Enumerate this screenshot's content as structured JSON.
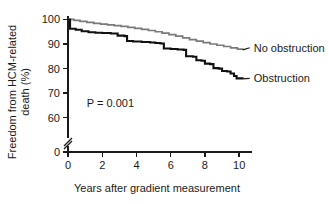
{
  "chart_data": {
    "type": "line",
    "title": "",
    "xlabel": "Years after gradient measurement",
    "ylabel_line1": "Freedom from HCM-related",
    "ylabel_line2": "death (%)",
    "xlim": [
      0,
      10.4
    ],
    "ylim": [
      55,
      101
    ],
    "xticks": [
      0,
      2,
      4,
      6,
      8,
      10
    ],
    "xtick_labels": [
      "0",
      "2",
      "4",
      "6",
      "8",
      "10"
    ],
    "yticks": [
      60,
      70,
      80,
      90,
      100
    ],
    "ytick_labels": [
      "60",
      "70",
      "80",
      "90",
      "100"
    ],
    "y_zero_label": "0",
    "axis_break": true,
    "grid": false,
    "legend_position": "inline-right",
    "annotations": [
      {
        "name": "p-value",
        "text": "P = 0.001",
        "x": 1.1,
        "y": 64.5
      }
    ],
    "series": [
      {
        "name": "No obstruction",
        "label": "No obstruction",
        "color": "#7a7a7a",
        "end_label_x": 10.5,
        "end_label_y": 88.5,
        "x": [
          0.0,
          0.35,
          0.7,
          1.1,
          1.5,
          1.9,
          2.3,
          2.7,
          3.1,
          3.5,
          3.9,
          4.3,
          4.7,
          5.1,
          5.5,
          5.9,
          6.3,
          6.7,
          7.1,
          7.5,
          7.9,
          8.3,
          8.7,
          9.1,
          9.5,
          9.9,
          10.2
        ],
        "y": [
          100.0,
          99.6,
          99.2,
          98.8,
          98.4,
          98.1,
          97.8,
          97.5,
          97.2,
          96.8,
          96.4,
          96.0,
          95.5,
          95.0,
          94.4,
          93.8,
          93.2,
          92.5,
          91.8,
          91.2,
          90.6,
          90.0,
          89.5,
          89.0,
          88.4,
          87.9,
          87.6
        ]
      },
      {
        "name": "Obstruction",
        "label": "Obstruction",
        "color": "#111111",
        "end_label_x": 10.5,
        "end_label_y": 76.0,
        "x": [
          0.0,
          0.12,
          0.45,
          0.8,
          1.2,
          1.6,
          2.0,
          2.5,
          2.9,
          3.3,
          3.45,
          3.8,
          4.3,
          4.8,
          5.1,
          5.4,
          5.6,
          6.0,
          6.4,
          6.75,
          6.9,
          7.3,
          7.5,
          7.8,
          8.0,
          8.3,
          8.5,
          8.8,
          9.0,
          9.3,
          9.5,
          9.7,
          9.85,
          10.2
        ],
        "y": [
          100.0,
          96.2,
          95.8,
          95.2,
          94.8,
          94.6,
          94.5,
          94.3,
          93.4,
          93.2,
          91.2,
          91.0,
          90.8,
          90.6,
          90.4,
          90.2,
          88.2,
          88.0,
          87.8,
          87.6,
          85.0,
          84.8,
          83.4,
          83.2,
          82.0,
          81.8,
          80.2,
          80.0,
          79.0,
          78.8,
          78.0,
          77.0,
          76.0,
          75.8
        ]
      }
    ]
  },
  "figure": {
    "plot_left_px": 68,
    "plot_right_px": 246,
    "plot_top_px": 17,
    "plot_bottom_px": 130,
    "axis_zero_px": 152
  }
}
